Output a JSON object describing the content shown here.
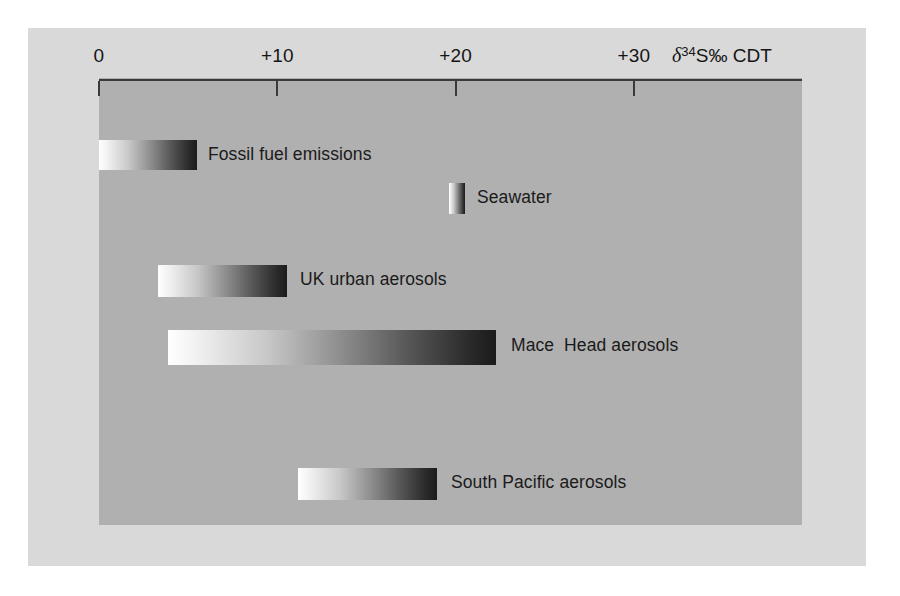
{
  "chart_data": {
    "type": "bar",
    "orientation": "horizontal",
    "title": "",
    "subtitle": "",
    "xlabel": "δ34S‰ CDT",
    "ylabel": "",
    "xlim": [
      0,
      39.4
    ],
    "grid": false,
    "legend": "none",
    "axis": {
      "unit_symbol": "δ",
      "unit_superscript": "34",
      "unit_rest": "S‰ CDT",
      "ticks": [
        {
          "value": 0,
          "label": "0"
        },
        {
          "value": 10,
          "label": "+10"
        },
        {
          "value": 20,
          "label": "+20"
        },
        {
          "value": 30,
          "label": "+30"
        }
      ]
    },
    "categories": [
      "Fossil fuel emissions",
      "Seawater",
      "UK urban aerosols",
      "Mace  Head aerosols",
      "South Pacific aerosols"
    ],
    "ranges": [
      {
        "label": "Fossil fuel emissions",
        "start": 0.0,
        "end": 5.5
      },
      {
        "label": "Seawater",
        "start": 19.6,
        "end": 20.5
      },
      {
        "label": "UK urban aerosols",
        "start": 3.3,
        "end": 10.5
      },
      {
        "label": "Mace  Head aerosols",
        "start": 3.9,
        "end": 22.3
      },
      {
        "label": "South Pacific aerosols",
        "start": 11.2,
        "end": 19.0
      }
    ],
    "bars": [
      {
        "name": "fossil-fuel-emissions",
        "label": "Fossil fuel emissions",
        "start": 0.0,
        "end": 5.5,
        "left_px": 99,
        "width_px": 98,
        "top_px": 140,
        "height_px": 30,
        "label_left_px": 208,
        "label_top_px": 144
      },
      {
        "name": "seawater",
        "label": "Seawater",
        "start": 19.6,
        "end": 20.5,
        "left_px": 449,
        "width_px": 16,
        "top_px": 183,
        "height_px": 31,
        "label_left_px": 477,
        "label_top_px": 187
      },
      {
        "name": "uk-urban-aerosols",
        "label": "UK urban aerosols",
        "start": 3.3,
        "end": 10.5,
        "left_px": 158,
        "width_px": 129,
        "top_px": 265,
        "height_px": 32,
        "label_left_px": 300,
        "label_top_px": 269
      },
      {
        "name": "mace-head-aerosols",
        "label": "Mace  Head aerosols",
        "start": 3.9,
        "end": 22.3,
        "left_px": 168,
        "width_px": 328,
        "top_px": 330,
        "height_px": 35,
        "label_left_px": 511,
        "label_top_px": 335
      },
      {
        "name": "south-pacific-aerosols",
        "label": "South Pacific aerosols",
        "start": 11.2,
        "end": 19.0,
        "left_px": 298,
        "width_px": 139,
        "top_px": 468,
        "height_px": 32,
        "label_left_px": 451,
        "label_top_px": 472
      }
    ],
    "colors": {
      "outer_panel": "#d9d9d9",
      "plot_panel": "#b0b0b0",
      "axis": "#3a3a3a",
      "text": "#151515",
      "bar_gradient_start": "#ffffff",
      "bar_gradient_end": "#1b1b1b",
      "page_background": "#ffffff"
    }
  }
}
